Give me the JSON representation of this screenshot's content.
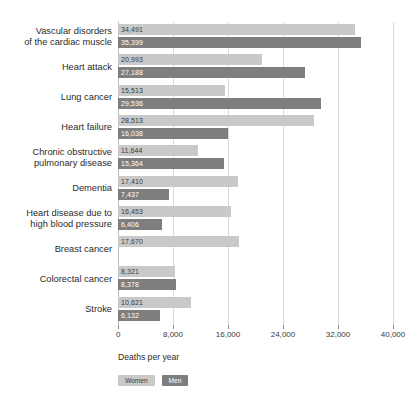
{
  "chart_data": {
    "type": "bar",
    "orientation": "horizontal",
    "grouped": true,
    "title": "",
    "xlabel": "Deaths per year",
    "ylabel": "",
    "xlim": [
      0,
      40000
    ],
    "grid": true,
    "legend_position": "bottom-left",
    "categories": [
      "Vascular disorders\nof the cardiac muscle",
      "Heart attack",
      "Lung cancer",
      "Heart failure",
      "Chronic obstructive\npulmonary disease",
      "Dementia",
      "Heart disease due to\nhigh blood pressure",
      "Breast cancer",
      "Colorectal cancer",
      "Stroke"
    ],
    "series": [
      {
        "name": "Women",
        "color": "#c9c9c9",
        "values": [
          34491,
          20993,
          15513,
          28513,
          11644,
          17410,
          16453,
          17670,
          8321,
          10621
        ],
        "labels": [
          "34,491",
          "20,993",
          "15,513",
          "28,513",
          "11,644",
          "17,410",
          "16,453",
          "17,670",
          "8,321",
          "10,621"
        ]
      },
      {
        "name": "Men",
        "color": "#7e7e7e",
        "values": [
          35399,
          27188,
          29536,
          16038,
          15364,
          7437,
          6406,
          null,
          8378,
          6132
        ],
        "labels": [
          "35,399",
          "27,188",
          "29,536",
          "16,038",
          "15,364",
          "7,437",
          "6,406",
          "",
          "8,378",
          "6,132"
        ]
      }
    ],
    "xticks": [
      0,
      8000,
      16000,
      24000,
      32000,
      40000
    ],
    "xticklabels": [
      "0",
      "8,000",
      "16,000",
      "24,000",
      "32,000",
      "40,000"
    ]
  },
  "axis": {
    "title": "Deaths per year"
  },
  "legend": {
    "women_label": "Women",
    "men_label": "Men"
  }
}
